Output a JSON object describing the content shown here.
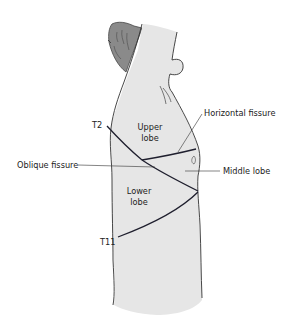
{
  "diagram": {
    "colors": {
      "skin": "#e6e6e6",
      "hair": "#8a8a8a",
      "outline": "#333333",
      "fissure": "#1f1f2e",
      "background": "#ffffff"
    },
    "labels": {
      "t2": "T2",
      "t11": "T11",
      "upper_lobe_line1": "Upper",
      "upper_lobe_line2": "lobe",
      "lower_lobe_line1": "Lower",
      "lower_lobe_line2": "lobe",
      "horizontal_fissure": "Horizontal fissure",
      "oblique_fissure": "Oblique fissure",
      "middle_lobe": "Middle lobe"
    }
  }
}
